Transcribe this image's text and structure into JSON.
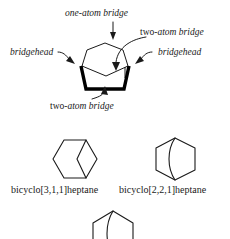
{
  "figure": {
    "kind": "chemistry-structure-diagram",
    "background_color": "#ffffff",
    "ink_color": "#1a1a1a"
  },
  "annotations": {
    "one_atom_bridge": "one-atom bridge",
    "two_atom_bridge_top_prefix": "two-",
    "two_atom_bridge_top_italic": "atom bridge",
    "two_atom_bridge_bottom_prefix": "two-",
    "two_atom_bridge_bottom_italic": "atom bridge",
    "bridgehead_left": "bridgehead",
    "bridgehead_right": "bridgehead"
  },
  "structures": {
    "left_name": "bicyclo[3,1,1]heptane",
    "right_name": "bicyclo[2,2,1]heptane"
  }
}
